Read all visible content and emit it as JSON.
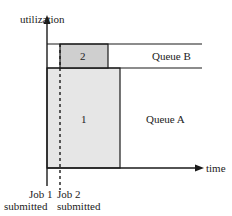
{
  "diagram": {
    "y_axis_label": "utilization",
    "x_axis_label": "time",
    "queues": [
      {
        "name": "Queue B"
      },
      {
        "name": "Queue A"
      }
    ],
    "jobs": [
      {
        "id": "1",
        "queue": "Queue A",
        "fill": "#e6e6e6"
      },
      {
        "id": "2",
        "queue": "Queue B",
        "fill": "#cfcfcf"
      }
    ],
    "events": [
      {
        "line1": "Job 1",
        "line2": "submitted"
      },
      {
        "line1": "Job 2",
        "line2": "submitted"
      }
    ],
    "colors": {
      "line": "#1a1a1a",
      "job1_fill": "#e6e6e6",
      "job2_fill": "#cfcfcf"
    }
  }
}
